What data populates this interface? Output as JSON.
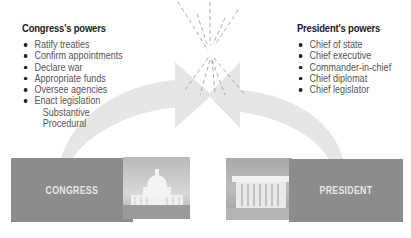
{
  "congress_panel": {
    "title": "Congress's powers",
    "items": [
      "Ratify treaties",
      "Confirm appointments",
      "Declare war",
      "Appropriate funds",
      "Oversee agencies",
      "Enact legislation"
    ],
    "subitems": [
      "Substantive",
      "Procedural"
    ]
  },
  "president_panel": {
    "title": "President's powers",
    "items": [
      "Chief of state",
      "Chief executive",
      "Commander-in-chief",
      "Chief diplomat",
      "Chief legislator"
    ]
  },
  "boxes": {
    "congress_label": "CONGRESS",
    "president_label": "PRESIDENT"
  },
  "colors": {
    "box_fill": "#8c8c8c",
    "arrow_fill": "#e6e6e6",
    "photo_bg": "#c8c8c8"
  }
}
